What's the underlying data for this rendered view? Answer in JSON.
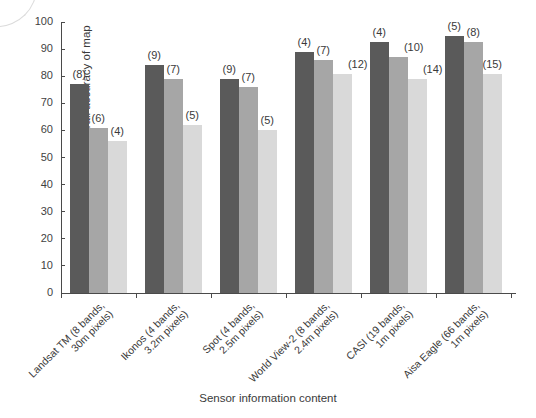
{
  "chart_data": {
    "type": "bar",
    "title": "",
    "xlabel": "Sensor information content",
    "ylabel": "% Overall accuracy of map",
    "ylim": [
      0,
      100
    ],
    "ytick_step": 10,
    "grid": false,
    "legend": "none",
    "categories": [
      "Landsat TM (8 bands, 30m pixels)",
      "Ikonos (4 bands, 3.2m pixels)",
      "Spot (4 bands, 2.5m pixels)",
      "World View-2 (8 bands, 2.4m pixels)",
      "CASI (19 bands, 1m pixels)",
      "Aisa Eagle (66 bands, 1m pixels)"
    ],
    "series": [
      {
        "name": "series-1",
        "color": "#5a5a5a",
        "values": [
          77,
          84,
          79,
          89,
          92.5,
          95
        ]
      },
      {
        "name": "series-2",
        "color": "#a6a6a6",
        "values": [
          61,
          79,
          76,
          86,
          87,
          92.5
        ]
      },
      {
        "name": "series-3",
        "color": "#d9d9d9",
        "values": [
          56,
          62,
          60,
          81,
          79,
          81
        ]
      }
    ],
    "bar_annotations": [
      [
        "(8)",
        "(6)",
        "(4)"
      ],
      [
        "(9)",
        "(7)",
        "(5)"
      ],
      [
        "(9)",
        "(7)",
        "(5)"
      ],
      [
        "(4)",
        "(7)",
        "(12)"
      ],
      [
        "(4)",
        "(10)",
        "(14)"
      ],
      [
        "(5)",
        "(8)",
        "(15)"
      ]
    ],
    "ytick_labels": [
      "0",
      "10",
      "20",
      "30",
      "40",
      "50",
      "60",
      "70",
      "80",
      "90",
      "100"
    ]
  },
  "axis": {
    "y_title": "% Overall accuracy of map",
    "x_title": "Sensor information content"
  },
  "category_lines": [
    {
      "line1": "Landsat TM (8 bands,",
      "line2": "30m pixels)"
    },
    {
      "line1": "Ikonos (4 bands,",
      "line2": "3.2m pixels)"
    },
    {
      "line1": "Spot (4 bands,",
      "line2": "2.5m pixels)"
    },
    {
      "line1": "World View-2 (8 bands,",
      "line2": "2.4m pixels)"
    },
    {
      "line1": "CASI (19 bands,",
      "line2": "1m pixels)"
    },
    {
      "line1": "Aisa Eagle (66 bands,",
      "line2": "1m pixels)"
    }
  ]
}
